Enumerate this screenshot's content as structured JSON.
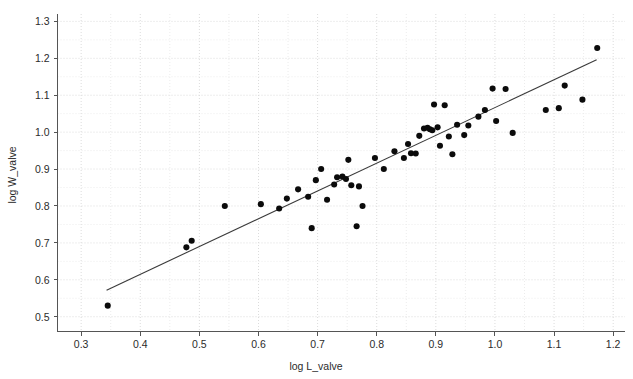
{
  "chart_data": {
    "type": "scatter",
    "title": "",
    "xlabel": "log L_valve",
    "ylabel": "log W_valve",
    "xlim": [
      0.26,
      1.22
    ],
    "ylim": [
      0.46,
      1.32
    ],
    "xticks": [
      0.3,
      0.4,
      0.5,
      0.6,
      0.7,
      0.8,
      0.9,
      1.0,
      1.1,
      1.2
    ],
    "xtick_labels": [
      "0.3",
      "0.4",
      "0.5",
      "0.6",
      "0.7",
      "0.8",
      "0.9",
      "1.0",
      "1.1",
      "1.2"
    ],
    "yticks": [
      0.5,
      0.6,
      0.7,
      0.8,
      0.9,
      1.0,
      1.1,
      1.2,
      1.3
    ],
    "ytick_labels": [
      "0.5",
      "0.6",
      "0.7",
      "0.8",
      "0.9",
      "1.0",
      "1.1",
      "1.2",
      "1.3"
    ],
    "grid": true,
    "minor_grid": true,
    "legend": null,
    "legend_position": "none",
    "marker": "filled-circle",
    "marker_color": "#0b0b0b",
    "marker_size": 4.3,
    "series": [
      {
        "name": "valve dimensions",
        "points": [
          [
            0.345,
            0.53
          ],
          [
            0.478,
            0.688
          ],
          [
            0.487,
            0.706
          ],
          [
            0.543,
            0.8
          ],
          [
            0.604,
            0.805
          ],
          [
            0.635,
            0.793
          ],
          [
            0.648,
            0.82
          ],
          [
            0.667,
            0.845
          ],
          [
            0.684,
            0.825
          ],
          [
            0.69,
            0.74
          ],
          [
            0.697,
            0.87
          ],
          [
            0.706,
            0.9
          ],
          [
            0.716,
            0.817
          ],
          [
            0.728,
            0.858
          ],
          [
            0.733,
            0.878
          ],
          [
            0.742,
            0.88
          ],
          [
            0.748,
            0.873
          ],
          [
            0.752,
            0.925
          ],
          [
            0.757,
            0.856
          ],
          [
            0.766,
            0.745
          ],
          [
            0.77,
            0.853
          ],
          [
            0.776,
            0.8
          ],
          [
            0.797,
            0.93
          ],
          [
            0.812,
            0.9
          ],
          [
            0.83,
            0.948
          ],
          [
            0.846,
            0.93
          ],
          [
            0.853,
            0.968
          ],
          [
            0.858,
            0.943
          ],
          [
            0.866,
            0.942
          ],
          [
            0.872,
            0.99
          ],
          [
            0.88,
            1.01
          ],
          [
            0.886,
            1.012
          ],
          [
            0.89,
            1.008
          ],
          [
            0.894,
            1.005
          ],
          [
            0.897,
            1.075
          ],
          [
            0.903,
            1.013
          ],
          [
            0.907,
            0.963
          ],
          [
            0.915,
            1.073
          ],
          [
            0.922,
            0.988
          ],
          [
            0.928,
            0.94
          ],
          [
            0.936,
            1.02
          ],
          [
            0.948,
            0.992
          ],
          [
            0.955,
            1.018
          ],
          [
            0.972,
            1.042
          ],
          [
            0.983,
            1.06
          ],
          [
            0.996,
            1.118
          ],
          [
            1.002,
            1.03
          ],
          [
            1.018,
            1.117
          ],
          [
            1.03,
            0.998
          ],
          [
            1.086,
            1.06
          ],
          [
            1.108,
            1.065
          ],
          [
            1.118,
            1.126
          ],
          [
            1.148,
            1.088
          ],
          [
            1.173,
            1.228
          ]
        ]
      }
    ],
    "fit_line": {
      "name": "least-squares fit",
      "x_start": 0.343,
      "y_start": 0.572,
      "x_end": 1.172,
      "y_end": 1.196,
      "color": "#3a3a3a"
    }
  }
}
